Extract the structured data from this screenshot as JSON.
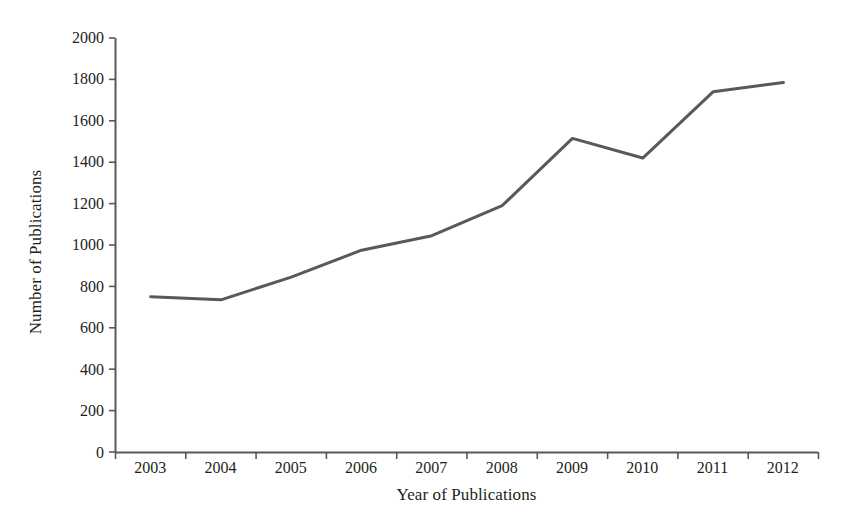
{
  "chart_data": {
    "type": "line",
    "title": "",
    "xlabel": "Year of Publications",
    "ylabel": "Number of Publications",
    "categories": [
      "2003",
      "2004",
      "2005",
      "2006",
      "2007",
      "2008",
      "2009",
      "2010",
      "2011",
      "2012"
    ],
    "values": [
      750,
      735,
      845,
      975,
      1045,
      1190,
      1515,
      1420,
      1740,
      1785
    ],
    "series": [
      {
        "name": "Number of Publications",
        "values": [
          750,
          735,
          845,
          975,
          1045,
          1190,
          1515,
          1420,
          1740,
          1785
        ]
      }
    ],
    "ylim": [
      0,
      2000
    ],
    "y_ticks": [
      0,
      200,
      400,
      600,
      800,
      1000,
      1200,
      1400,
      1600,
      1800,
      2000
    ],
    "y_tick_labels": [
      "0",
      "200",
      "400",
      "600",
      "800",
      "1000",
      "1200",
      "1400",
      "1600",
      "1800",
      "2000"
    ],
    "x_tick_labels": [
      "2003",
      "2004",
      "2005",
      "2006",
      "2007",
      "2008",
      "2009",
      "2010",
      "2011",
      "2012"
    ],
    "grid": false,
    "legend": false,
    "legend_position": "none",
    "markers": false,
    "line_color": "#595959",
    "axis_color": "#595959",
    "background_color": "#ffffff",
    "text_color": "#231f20"
  }
}
